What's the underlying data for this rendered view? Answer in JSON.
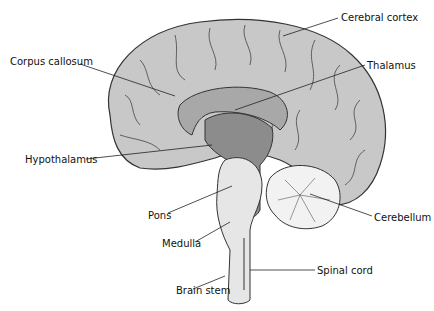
{
  "diagram": {
    "labels": [
      {
        "id": "cerebral-cortex",
        "text": "Cerebral cortex",
        "x": 341,
        "y": 12
      },
      {
        "id": "corpus-callosum",
        "text": "Corpus callosum",
        "x": 10,
        "y": 56
      },
      {
        "id": "thalamus",
        "text": "Thalamus",
        "x": 367,
        "y": 60
      },
      {
        "id": "hypothalamus",
        "text": "Hypothalamus",
        "x": 25,
        "y": 154
      },
      {
        "id": "pons",
        "text": "Pons",
        "x": 148,
        "y": 210
      },
      {
        "id": "cerebellum",
        "text": "Cerebellum",
        "x": 374,
        "y": 212
      },
      {
        "id": "medulla",
        "text": "Medulla",
        "x": 162,
        "y": 238
      },
      {
        "id": "spinal-cord",
        "text": "Spinal cord",
        "x": 317,
        "y": 265
      },
      {
        "id": "brain-stem",
        "text": "Brain stem",
        "x": 176,
        "y": 285
      }
    ],
    "colors": {
      "cortex": "#c8c8c8",
      "corpus_callosum": "#a8a8a8",
      "thalamus": "#8c8c8c",
      "brainstem": "#e6e6e6",
      "cerebellum": "#f2f2f2",
      "outline": "#333333"
    }
  }
}
